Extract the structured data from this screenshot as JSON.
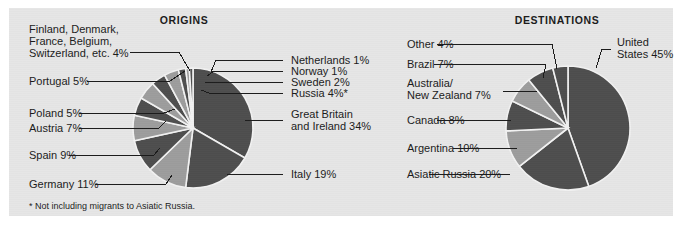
{
  "figure": {
    "background_color": "#ffffff",
    "panel_color": "#e6e6e6",
    "text_color": "#1b1b1b",
    "footnote": "* Not including migrants to Asiatic Russia."
  },
  "palette": {
    "dark": "#4e4e4e",
    "light": "#9d9d9d",
    "divider": "#f2f2f2"
  },
  "chart_data": [
    {
      "type": "pie",
      "title": "ORIGINS",
      "id": "origins",
      "start_angle_deg": -90,
      "direction": "clockwise",
      "total_percent": 100,
      "note": "* Not including migrants to Asiatic Russia.",
      "categories": [
        "Great Britain and Ireland",
        "Italy",
        "Germany",
        "Spain",
        "Austria",
        "Poland",
        "Portugal",
        "Finland, Denmark, France, Belgium, Switzerland, etc.",
        "Russia",
        "Sweden",
        "Norway",
        "Netherlands"
      ],
      "values": [
        34,
        19,
        11,
        9,
        7,
        5,
        5,
        4,
        4,
        2,
        1,
        1
      ],
      "labels": [
        "Great Britain",
        "and Ireland 34%",
        "Italy 19%",
        "Germany 11%",
        "Spain 9%",
        "Austria 7%",
        "Poland 5%",
        "Portugal 5%",
        "Finland, Denmark,",
        "France, Belgium,",
        "Switzerland, etc. 4%",
        "Russia 4%*",
        "Sweden 2%",
        "Norway 1%",
        "Netherlands 1%"
      ]
    },
    {
      "type": "pie",
      "title": "DESTINATIONS",
      "id": "destinations",
      "start_angle_deg": -90,
      "direction": "clockwise",
      "total_percent": 101,
      "categories": [
        "United States",
        "Asiatic Russia",
        "Argentina",
        "Canada",
        "Australia/New Zealand",
        "Brazil",
        "Other"
      ],
      "values": [
        45,
        20,
        10,
        8,
        7,
        7,
        4
      ],
      "labels": [
        "United",
        "States 45%",
        "Asiatic Russia 20%",
        "Argentina 10%",
        "Canada 8%",
        "Australia/",
        "New Zealand 7%",
        "Brazil 7%",
        "Other 4%"
      ]
    }
  ],
  "origins": {
    "title": "ORIGINS",
    "labels": {
      "great_britain_l1": "Great Britain",
      "great_britain_l2": "and Ireland 34%",
      "italy": "Italy 19%",
      "germany": "Germany 11%",
      "spain": "Spain 9%",
      "austria": "Austria 7%",
      "poland": "Poland 5%",
      "portugal": "Portugal 5%",
      "misc_l1": "Finland, Denmark,",
      "misc_l2": "France, Belgium,",
      "misc_l3": "Switzerland, etc. 4%",
      "russia": "Russia 4%*",
      "sweden": "Sweden 2%",
      "norway": "Norway 1%",
      "netherlands": "Netherlands 1%"
    }
  },
  "destinations": {
    "title": "DESTINATIONS",
    "labels": {
      "united_states_l1": "United",
      "united_states_l2": "States 45%",
      "asiatic_russia": "Asiatic Russia 20%",
      "argentina": "Argentina 10%",
      "canada": "Canada 8%",
      "australia_l1": "Australia/",
      "australia_l2": "New Zealand 7%",
      "brazil": "Brazil 7%",
      "other": "Other 4%"
    }
  }
}
